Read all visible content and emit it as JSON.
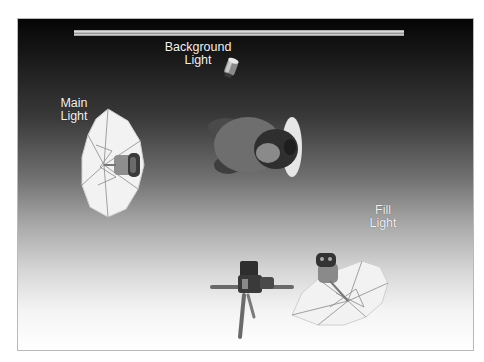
{
  "diagram": {
    "type": "studio lighting setup (overhead view)",
    "labels": {
      "background_light": [
        "Background",
        "Light"
      ],
      "main_light": [
        "Main",
        "Light"
      ],
      "fill_light": [
        "Fill",
        "Light"
      ]
    },
    "elements": [
      "backdrop",
      "background-light",
      "main-light-umbrella",
      "subject",
      "fill-light-umbrella",
      "camera-on-tripod"
    ],
    "colors": {
      "backdrop_top": "#050505",
      "floor_bottom": "#ffffff",
      "label_text": "#f2f2f2",
      "umbrella": "#f4f4f4"
    }
  }
}
